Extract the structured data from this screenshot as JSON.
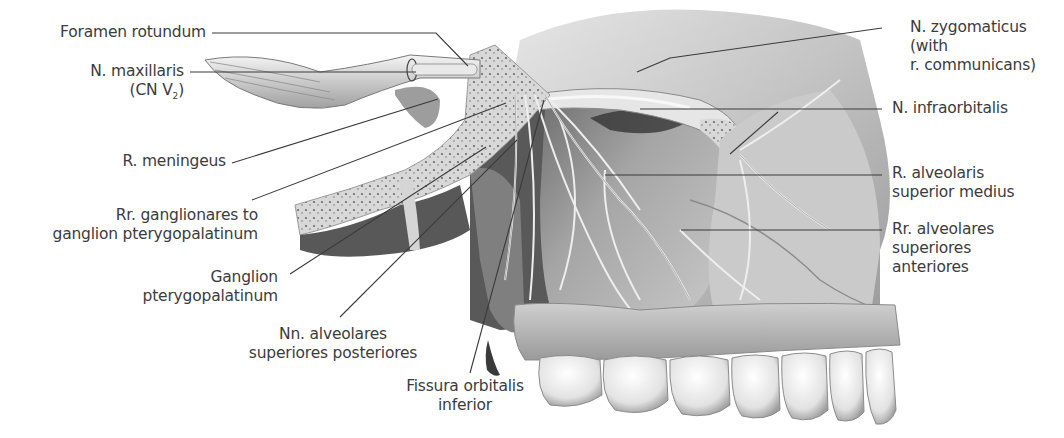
{
  "figure": {
    "type": "anatomical-illustration",
    "labels": {
      "foramen_rotundum": {
        "line1": "Foramen  rotundum"
      },
      "n_maxillaris": {
        "line1": "N. maxillaris",
        "line2_prefix": "(CN V",
        "line2_sub": "2",
        "line2_suffix": ")"
      },
      "r_meningeus": {
        "line1": "R. meningeus"
      },
      "rr_ganglionares": {
        "line1": "Rr. ganglionares to",
        "line2": "ganglion pterygopalatinum"
      },
      "ganglion_pterygopalatinum": {
        "line1": "Ganglion",
        "line2": "pterygopalatinum"
      },
      "nn_alveolares_posteriores": {
        "line1": "Nn. alveolares",
        "line2": "superiores posteriores"
      },
      "fissura_orbitalis": {
        "line1": "Fissura orbitalis",
        "line2": "inferior"
      },
      "n_zygomaticus": {
        "line1": "N. zygomaticus",
        "line2": "(with",
        "line3": "r. communicans)"
      },
      "n_infraorbitalis": {
        "line1": "N. infraorbitalis"
      },
      "r_alveolaris_medius": {
        "line1": "R. alveolaris",
        "line2": "superior medius"
      },
      "rr_alveolares_anteriores": {
        "line1": "Rr. alveolares",
        "line2": "superiores",
        "line3": "anteriores"
      }
    },
    "colors": {
      "background": "#ffffff",
      "text": "#3c3c3c",
      "leader_line": "#3a3a3a",
      "bone_light": "#d9d9d9",
      "bone_mid": "#a8a8a8",
      "shadow": "#2e2e2e",
      "nerve": "#eeeeee"
    }
  }
}
